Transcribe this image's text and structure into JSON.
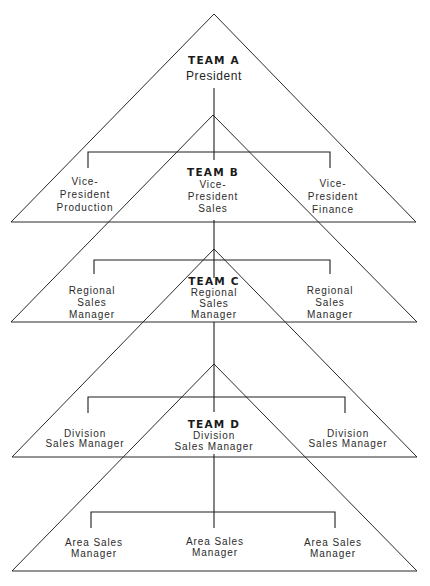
{
  "diagram": {
    "teams": [
      {
        "name": "TEAM A",
        "head": [
          "President"
        ],
        "members": []
      },
      {
        "name": "TEAM B",
        "head": [
          "Vice-",
          "President",
          "Sales"
        ],
        "members": [
          [
            "Vice-",
            "President",
            "Production"
          ],
          [
            "Vice-",
            "President",
            "Finance"
          ]
        ]
      },
      {
        "name": "TEAM C",
        "head": [
          "Regional",
          "Sales",
          "Manager"
        ],
        "members": [
          [
            "Regional",
            "Sales",
            "Manager"
          ],
          [
            "Regional",
            "Sales",
            "Manager"
          ]
        ]
      },
      {
        "name": "TEAM D",
        "head": [
          "Division",
          "Sales Manager"
        ],
        "members": [
          [
            "Division",
            "Sales Manager"
          ],
          [
            "Division",
            "Sales Manager"
          ]
        ]
      }
    ],
    "bottom_level": [
      [
        "Area Sales",
        "Manager"
      ],
      [
        "Area Sales",
        "Manager"
      ],
      [
        "Area Sales",
        "Manager"
      ]
    ]
  }
}
